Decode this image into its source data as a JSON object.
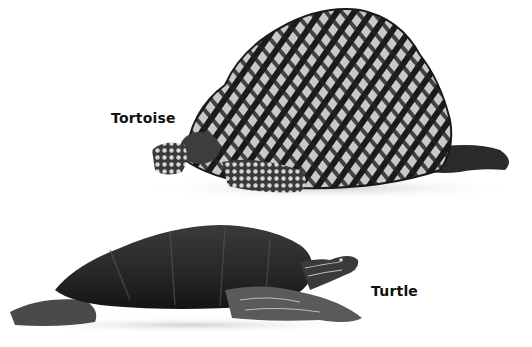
{
  "figure": {
    "subjects": [
      {
        "id": "tortoise",
        "label": "Tortoise"
      },
      {
        "id": "turtle",
        "label": "Turtle"
      }
    ],
    "colors": {
      "background": "#ffffff",
      "label_text": "#111111",
      "shell_dark": "#1c1c1c",
      "shell_light": "#b8b8b8"
    }
  }
}
